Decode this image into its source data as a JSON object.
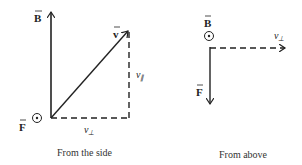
{
  "side_view": {
    "caption": "From the side",
    "labels": {
      "B": "B",
      "v": "v",
      "F": "F",
      "v_parallel": "v",
      "v_parallel_sub": "∥",
      "v_perp": "v",
      "v_perp_sub": "⊥"
    },
    "symbols": {
      "F_direction": "out-of-page-dot"
    }
  },
  "top_view": {
    "caption": "From above",
    "labels": {
      "B": "B",
      "F": "F",
      "v_perp": "v",
      "v_perp_sub": "⊥"
    },
    "symbols": {
      "B_direction": "out-of-page-dot"
    }
  },
  "colors": {
    "stroke": "#222222",
    "background": "#ffffff"
  }
}
